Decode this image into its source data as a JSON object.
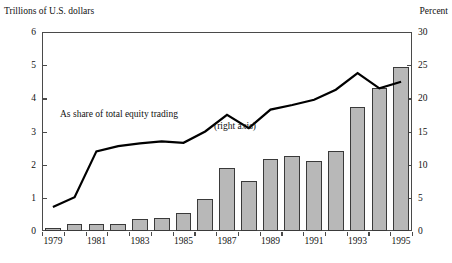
{
  "chart_data": {
    "type": "bar",
    "title": "",
    "subtitle": "",
    "xlabel": "",
    "ylabel": "Trillions of U.S. dollars",
    "y2label": "Percent",
    "ylim": [
      0,
      6
    ],
    "y2lim": [
      0,
      30
    ],
    "grid": false,
    "legend_position": "inline-annotation",
    "annotations": [
      "As share of total equity trading",
      "(right axis)"
    ],
    "x": [
      1979,
      1980,
      1981,
      1982,
      1983,
      1984,
      1985,
      1986,
      1987,
      1988,
      1989,
      1990,
      1991,
      1992,
      1993,
      1994,
      1995
    ],
    "categories": [
      "1979",
      "1980",
      "1981",
      "1982",
      "1983",
      "1984",
      "1985",
      "1986",
      "1987",
      "1988",
      "1989",
      "1990",
      "1991",
      "1992",
      "1993",
      "1994",
      "1995"
    ],
    "xtick_labels": [
      "1979",
      "1981",
      "1983",
      "1985",
      "1987",
      "1989",
      "1991",
      "1993",
      "1995"
    ],
    "ytick_labels_left": [
      "0",
      "1",
      "2",
      "3",
      "4",
      "5",
      "6"
    ],
    "ytick_labels_right": [
      "0",
      "5",
      "10",
      "15",
      "20",
      "25",
      "30"
    ],
    "series": [
      {
        "name": "Value (trillions of U.S. dollars)",
        "type": "bar",
        "axis": "left",
        "color": "#b8b8b8",
        "edge_color": "#3a3a3a",
        "values": [
          0.08,
          0.22,
          0.21,
          0.21,
          0.37,
          0.4,
          0.53,
          0.97,
          1.9,
          1.5,
          2.18,
          2.25,
          2.12,
          2.4,
          3.75,
          4.3,
          4.95
        ]
      },
      {
        "name": "As share of total equity trading",
        "type": "line",
        "axis": "right",
        "color": "#000000",
        "values": [
          3.6,
          5.1,
          12.0,
          12.8,
          13.2,
          13.5,
          13.3,
          15.0,
          17.5,
          15.5,
          18.3,
          19.0,
          19.8,
          21.3,
          23.8,
          21.5,
          22.5
        ]
      }
    ]
  },
  "axes": {
    "left_title": "Trillions of U.S. dollars",
    "right_title": "Percent"
  },
  "annotation": {
    "line1": "As share of total equity trading",
    "line2": "(right axis)"
  }
}
